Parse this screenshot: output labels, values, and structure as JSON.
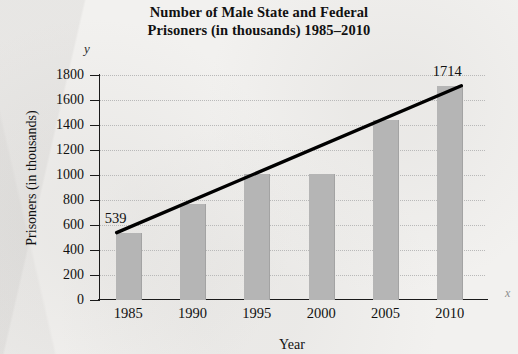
{
  "chart_data": {
    "type": "bar",
    "title": "Number of Male State and Federal Prisoners (in thousands) 1985–2010",
    "title_lines": [
      "Number of Male State and Federal",
      "Prisoners (in thousands) 1985–2010"
    ],
    "xlabel": "Year",
    "ylabel": "Prisoners (in thousands)",
    "axis_letter_y": "y",
    "axis_letter_x": "x",
    "categories": [
      "1985",
      "1990",
      "1995",
      "2000",
      "2005",
      "2010"
    ],
    "values": [
      539,
      770,
      1010,
      1010,
      1440,
      1714
    ],
    "ylim": [
      0,
      1800
    ],
    "ytick_step": 200,
    "ytick_labels": [
      "1800",
      "1600",
      "1400",
      "1200",
      "1000",
      "800",
      "600",
      "400",
      "200",
      "0"
    ],
    "grid": "horizontal-dotted",
    "legend": "none",
    "annotations": [
      {
        "name": "first-bar-value",
        "text": "539",
        "category": "1985",
        "value": 539
      },
      {
        "name": "last-bar-value",
        "text": "1714",
        "category": "2010",
        "value": 1714
      }
    ],
    "overlay_series": {
      "name": "trend-line",
      "type": "line",
      "points": [
        {
          "x": "1985",
          "y": 539
        },
        {
          "x": "2010",
          "y": 1714
        }
      ]
    },
    "colors": {
      "bar_fill": "#b5b5b5",
      "axis": "#1a1a1a",
      "gridline": "#b9b9b9",
      "trend_line": "#000000",
      "background": "#f2f1ef",
      "text": "#111111"
    }
  }
}
